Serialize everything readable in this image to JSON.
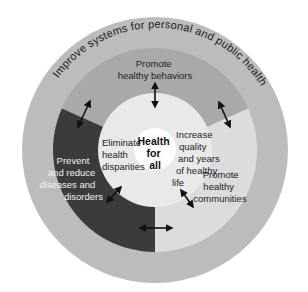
{
  "diagram": {
    "title": "Health for all",
    "outer_ring": {
      "label": "Improve systems for personal and public health",
      "color": "#bcbcbc"
    },
    "segments": {
      "top": {
        "lines": [
          "Promote",
          "healthy behaviors"
        ],
        "color": "#a9a9a9"
      },
      "left": {
        "lines": [
          "Prevent",
          "and reduce",
          "diseases and",
          "disorders"
        ],
        "color": "#3b3b3b"
      },
      "right": {
        "lines": [
          "Promote",
          "healthy",
          "communities"
        ],
        "color": "#dcdcdc"
      }
    },
    "inner_ring": {
      "color": "#e9e9e9",
      "left": {
        "lines": [
          "Eliminate",
          "health",
          "disparities"
        ]
      },
      "right": {
        "lines": [
          "Increase",
          "quality",
          "and years",
          "of healthy",
          "life"
        ]
      }
    },
    "center": {
      "lines": [
        "Health",
        "for",
        "all"
      ],
      "color": "#ffffff"
    },
    "arrows": [
      "bidirectional-top",
      "bidirectional-upper-left",
      "bidirectional-upper-right",
      "bidirectional-lower-left",
      "bidirectional-lower-right",
      "bidirectional-bottom"
    ]
  }
}
